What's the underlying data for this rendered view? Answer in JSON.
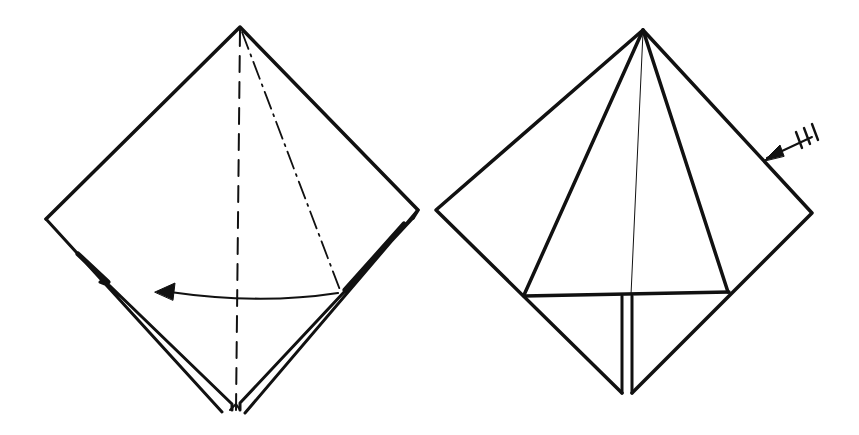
{
  "diagram": {
    "type": "origami-instructions",
    "background": "#ffffff",
    "ink": "#111111",
    "steps": [
      {
        "id": "step-left",
        "description": "Diamond base with vertical valley fold (dashed) and angled mountain fold (dash-dot); curved arrow indicates folding flap to the left",
        "fold_lines": [
          "valley-fold-vertical",
          "mountain-fold-diagonal"
        ],
        "arrow": "curved-arrow-left"
      },
      {
        "id": "step-right",
        "description": "Resulting shape: kite flaps from top point meeting a horizontal edge; repeat-arrow indicates repeat on the other side",
        "symbols": [
          "repeat-behind-arrow"
        ]
      }
    ]
  }
}
